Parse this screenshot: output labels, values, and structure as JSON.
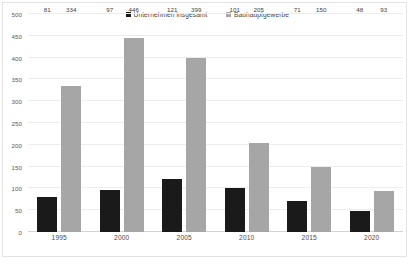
{
  "chart_data": {
    "type": "bar",
    "title": "",
    "subtitle": "",
    "xlabel": "",
    "ylabel": "",
    "categories": [
      "1995",
      "2000",
      "2005",
      "2010",
      "2015",
      "2020"
    ],
    "series": [
      {
        "name": "Unternehmen insgesamt",
        "color": "#1a1a1a",
        "values": [
          81,
          97,
          121,
          101,
          71,
          48
        ]
      },
      {
        "name": "Bauhauptgewerbe",
        "color": "#a6a6a6",
        "values": [
          334,
          446,
          399,
          205,
          150,
          93
        ]
      }
    ],
    "ylim": [
      0,
      500
    ],
    "ytick_step": 50,
    "yticks": [
      0,
      50,
      100,
      150,
      200,
      250,
      300,
      350,
      400,
      450,
      500
    ],
    "ytick_labels": [
      "0",
      "50",
      "100",
      "150",
      "200",
      "250",
      "300",
      "350",
      "400",
      "450",
      "500"
    ],
    "grid": true,
    "grid_axis": "y",
    "grid_color": "#ededed",
    "legend_position": "top-center",
    "data_labels": true,
    "border": true,
    "border_color": "#e3e3e3",
    "background": "#ffffff"
  }
}
